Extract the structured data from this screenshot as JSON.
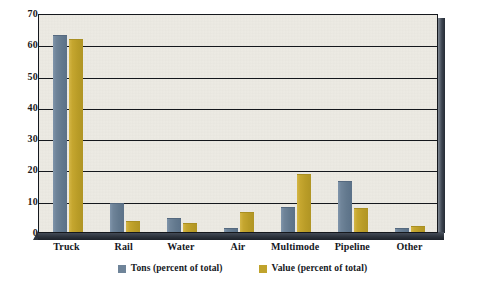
{
  "chart_data": {
    "type": "bar",
    "title": "",
    "subtitle": "",
    "xlabel": "",
    "ylabel": "",
    "ylim": [
      0,
      70
    ],
    "ytick_step": 10,
    "yticks": [
      "0",
      "10",
      "20",
      "30",
      "40",
      "50",
      "60",
      "70"
    ],
    "grid": true,
    "grid_axis": "y",
    "legend_position": "bottom-center",
    "categories": [
      "Truck",
      "Rail",
      "Water",
      "Air",
      "Multimode",
      "Pipeline",
      "Other"
    ],
    "series": [
      {
        "name": "Tons (percent of total)",
        "color": "#6f8499",
        "values": [
          62.5,
          8.8,
          4.3,
          1.1,
          7.8,
          16.0,
          1.0
        ]
      },
      {
        "name": "Value (percent of total)",
        "color": "#c0a32c",
        "values": [
          61.5,
          3.2,
          2.7,
          6.0,
          18.3,
          7.2,
          1.5
        ]
      }
    ]
  },
  "colors": {
    "plot_background": "#eceae3",
    "page_background": "#ffffff",
    "axis": "#15181d",
    "gridline": "#15181d",
    "frame_shadow": "#2b313a",
    "series_tons": "#6f8499",
    "series_value": "#c0a32c"
  }
}
